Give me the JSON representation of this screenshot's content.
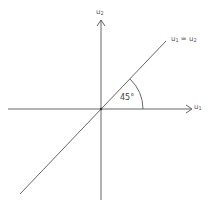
{
  "diagram": {
    "axes": {
      "vertical": {
        "name": "u",
        "subscript": "2"
      },
      "horizontal": {
        "name": "u",
        "subscript": "1"
      }
    },
    "diagonal_line": {
      "lhs_name": "u",
      "lhs_sub": "1",
      "equals": "=",
      "rhs_name": "u",
      "rhs_sub": "2"
    },
    "angle": {
      "label": "45°"
    },
    "colors": {
      "stroke": "#555555",
      "background": "#ffffff"
    }
  }
}
